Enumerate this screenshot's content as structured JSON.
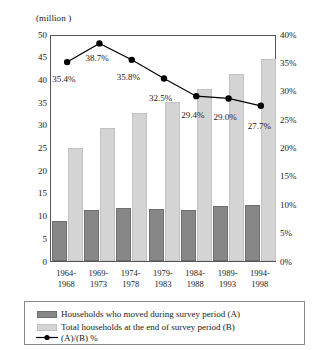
{
  "chart_data": {
    "type": "bar",
    "title": "",
    "units_caption": "(million )",
    "xlabel": "",
    "ylabel": "",
    "ylim": [
      0,
      50
    ],
    "y2lim": [
      0,
      40
    ],
    "grid": false,
    "legend_position": "bottom",
    "categories": [
      "1964-\n1968",
      "1969-\n1973",
      "1974-\n1978",
      "1979-\n1983",
      "1984-\n1988",
      "1989-\n1993",
      "1994-\n1998"
    ],
    "category_lines": [
      [
        "1964-",
        "1968"
      ],
      [
        "1969-",
        "1973"
      ],
      [
        "1974-",
        "1978"
      ],
      [
        "1979-",
        "1983"
      ],
      [
        "1984-",
        "1988"
      ],
      [
        "1989-",
        "1993"
      ],
      [
        "1994-",
        "1998"
      ]
    ],
    "series": [
      {
        "name": "Households who moved during survey period (A)",
        "axis": "left",
        "type": "bar",
        "color": "#878787",
        "values": [
          8.8,
          11.3,
          11.6,
          11.5,
          11.2,
          12.1,
          12.4
        ]
      },
      {
        "name": "Total households at the end of  survey period (B)",
        "axis": "left",
        "type": "bar",
        "color": "#d4d4d4",
        "values": [
          24.8,
          29.2,
          32.5,
          35.0,
          37.8,
          41.1,
          44.5
        ]
      },
      {
        "name": "(A)/(B) %",
        "axis": "right",
        "type": "line",
        "color": "#000000",
        "values": [
          35.4,
          38.7,
          35.8,
          32.5,
          29.4,
          29.0,
          27.7
        ],
        "data_labels": [
          "35.4%",
          "38.7%",
          "35.8%",
          "32.5%",
          "29.4%",
          "29.0%",
          "27.7%"
        ]
      }
    ],
    "y_axis_left": {
      "ticks": [
        0,
        5,
        10,
        15,
        20,
        25,
        30,
        35,
        40,
        45,
        50
      ],
      "tick_labels": [
        "0",
        "5",
        "10",
        "15",
        "20",
        "25",
        "30",
        "35",
        "40",
        "45",
        "50"
      ]
    },
    "y_axis_right": {
      "ticks": [
        0,
        5,
        10,
        15,
        20,
        25,
        30,
        35,
        40
      ],
      "tick_labels": [
        "0%",
        "5%",
        "10%",
        "15%",
        "20%",
        "25%",
        "30%",
        "35%",
        "40%"
      ]
    },
    "legend": [
      {
        "label": "Households who moved during survey period (A)",
        "marker": "swatch-dark"
      },
      {
        "label": "Total households at the end of  survey period (B)",
        "marker": "swatch-light"
      },
      {
        "label": "(A)/(B) %",
        "marker": "line-marker"
      }
    ]
  }
}
